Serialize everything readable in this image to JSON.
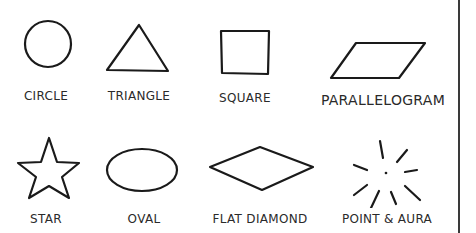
{
  "shapes": [
    {
      "id": "circle",
      "label": "CIRCLE"
    },
    {
      "id": "triangle",
      "label": "TRIANGLE"
    },
    {
      "id": "square",
      "label": "SQUARE"
    },
    {
      "id": "parallelogram",
      "label": "PARALLELOGRAM"
    },
    {
      "id": "star",
      "label": "STAR"
    },
    {
      "id": "oval",
      "label": "OVAL"
    },
    {
      "id": "flat-diamond",
      "label": "FLAT DIAMOND"
    },
    {
      "id": "point-aura",
      "label": "POINT & AURA"
    }
  ]
}
